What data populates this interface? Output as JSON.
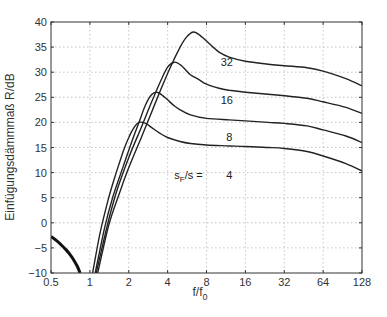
{
  "chart_data": {
    "type": "line",
    "title": "",
    "xlabel": "f/f0",
    "xlabel_main": "f/f",
    "xlabel_sub": "0",
    "ylabel": "Einfügungsdämmmaß R/dB",
    "xscale": "log2",
    "xlim": [
      0.5,
      128
    ],
    "ylim": [
      -10,
      40
    ],
    "grid": true,
    "x_ticks": [
      0.5,
      1,
      2,
      4,
      8,
      16,
      32,
      64,
      128
    ],
    "x_tick_labels": [
      "0.5",
      "1",
      "2",
      "4",
      "8",
      "16",
      "32",
      "64",
      "128"
    ],
    "y_ticks": [
      -10,
      -5,
      0,
      5,
      10,
      15,
      20,
      25,
      30,
      35,
      40
    ],
    "y_tick_labels": [
      "−10",
      "−5",
      "0",
      "5",
      "10",
      "15",
      "20",
      "25",
      "30",
      "35",
      "40"
    ],
    "annotations": [
      {
        "text": "32",
        "x": 11.5,
        "y": 32
      },
      {
        "text": "16",
        "x": 11.5,
        "y": 24.5
      },
      {
        "text": "8",
        "x": 12,
        "y": 17
      },
      {
        "text": "4",
        "x": 12,
        "y": 9.5
      },
      {
        "text_main": "s",
        "text_sub": "F",
        "text_rest": "/s =",
        "x": 5.2,
        "y": 9.5
      }
    ],
    "series": [
      {
        "name": "sF/s = 4",
        "x": [
          1.05,
          1.2,
          1.4,
          1.6,
          1.8,
          2.0,
          2.2,
          2.4,
          2.7,
          3.0,
          3.5,
          4,
          5,
          6,
          8,
          12,
          16,
          24,
          32,
          48,
          64,
          96,
          128
        ],
        "y": [
          -10,
          -2,
          5,
          10,
          14,
          17,
          19,
          20,
          19.8,
          19,
          17.8,
          17,
          16.2,
          15.8,
          15.5,
          15.3,
          15.2,
          15.0,
          14.8,
          14.2,
          13.3,
          11.8,
          10.3
        ]
      },
      {
        "name": "sF/s = 8",
        "x": [
          1.1,
          1.3,
          1.5,
          1.8,
          2.1,
          2.4,
          2.7,
          3.0,
          3.3,
          3.6,
          4,
          4.5,
          5,
          6,
          8,
          12,
          16,
          24,
          32,
          48,
          64,
          96,
          128
        ],
        "y": [
          -10,
          -1,
          5,
          11,
          16,
          20,
          23.5,
          25.5,
          26,
          25.5,
          24.5,
          23.3,
          22.5,
          21.5,
          20.8,
          20.5,
          20.3,
          20.0,
          19.8,
          19.3,
          18.5,
          17.3,
          16.0
        ]
      },
      {
        "name": "sF/s = 16",
        "x": [
          1.12,
          1.35,
          1.6,
          2.0,
          2.5,
          3.0,
          3.5,
          4.0,
          4.5,
          5.0,
          5.5,
          6,
          7,
          8,
          10,
          12,
          16,
          24,
          32,
          48,
          64,
          96,
          128
        ],
        "y": [
          -10,
          -1,
          6,
          13,
          19,
          24,
          28,
          31,
          32,
          31.5,
          30.5,
          29.5,
          28.5,
          27.6,
          26.8,
          26.4,
          26.0,
          25.6,
          25.3,
          24.8,
          24.1,
          23.0,
          21.8
        ]
      },
      {
        "name": "sF/s = 32",
        "x": [
          1.15,
          1.4,
          1.7,
          2.0,
          2.5,
          3.0,
          3.6,
          4.2,
          5.0,
          5.6,
          6.3,
          7.0,
          8,
          9,
          10,
          12,
          16,
          24,
          32,
          48,
          64,
          96,
          128
        ],
        "y": [
          -10,
          -0.5,
          6,
          11,
          17,
          22,
          27,
          31,
          35,
          37,
          38,
          37.5,
          36.2,
          35,
          34,
          33,
          32.2,
          31.6,
          31.3,
          30.9,
          30.2,
          28.7,
          27.3
        ]
      },
      {
        "name": "low-frequency branch",
        "x": [
          0.5,
          0.55,
          0.6,
          0.65,
          0.7,
          0.75,
          0.8,
          0.84
        ],
        "y": [
          -2.7,
          -3.5,
          -4.4,
          -5.3,
          -6.3,
          -7.4,
          -8.7,
          -10
        ]
      }
    ]
  }
}
